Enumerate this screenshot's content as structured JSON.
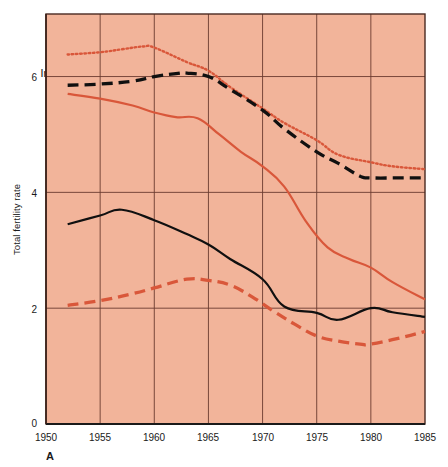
{
  "figure": {
    "panel_letter": "A",
    "background_color": "#ffffff",
    "plot_background_color": "#f2b49a",
    "axis_color": "#4a2a22",
    "grid_color": "#6b3b30"
  },
  "chart_data": {
    "type": "line",
    "title": "",
    "xlabel": "",
    "ylabel": "Total fertility rate",
    "xlim": [
      1950,
      1985
    ],
    "ylim": [
      0,
      7.08
    ],
    "grid": true,
    "legend": "inline-labels",
    "xticks": [
      "1950",
      "1955",
      "1960",
      "1965",
      "1970",
      "1975",
      "1980",
      "1985"
    ],
    "yticks": [
      "0",
      "2",
      "4",
      "6"
    ],
    "series": [
      {
        "name": "India",
        "color": "#d9573a",
        "style": "dotted",
        "label_x": 1951.2,
        "label_y": 6.85,
        "x": [
          1952,
          1955,
          1957,
          1959,
          1960,
          1963,
          1965,
          1967,
          1970,
          1972,
          1975,
          1977,
          1980,
          1982,
          1985
        ],
        "y": [
          6.38,
          6.42,
          6.47,
          6.52,
          6.5,
          6.25,
          6.1,
          5.82,
          5.45,
          5.2,
          4.9,
          4.65,
          4.52,
          4.45,
          4.4
        ]
      },
      {
        "name": "Indonesia",
        "color": "#101010",
        "style": "dashed",
        "label_x": 1950.6,
        "label_y": 6.02,
        "x": [
          1952,
          1955,
          1958,
          1960,
          1962,
          1963,
          1965,
          1967,
          1970,
          1972,
          1975,
          1977,
          1979,
          1980,
          1983,
          1985
        ],
        "y": [
          5.85,
          5.87,
          5.92,
          6.0,
          6.05,
          6.06,
          6.0,
          5.78,
          5.42,
          5.1,
          4.7,
          4.5,
          4.28,
          4.25,
          4.25,
          4.25
        ]
      },
      {
        "name": "China",
        "color": "#d9573a",
        "style": "solid",
        "label_x": 1951.2,
        "label_y": 5.35,
        "x": [
          1952,
          1955,
          1958,
          1960,
          1962,
          1964,
          1966,
          1968,
          1970,
          1972,
          1974,
          1976,
          1978,
          1980,
          1982,
          1985
        ],
        "y": [
          5.7,
          5.62,
          5.5,
          5.38,
          5.3,
          5.28,
          5.0,
          4.7,
          4.45,
          4.1,
          3.5,
          3.05,
          2.85,
          2.7,
          2.45,
          2.15
        ]
      },
      {
        "name": "U.S.",
        "color": "#101010",
        "style": "solid",
        "label_x": 1951.2,
        "label_y": 3.78,
        "x": [
          1952,
          1955,
          1957,
          1960,
          1963,
          1965,
          1967,
          1970,
          1972,
          1975,
          1977,
          1980,
          1982,
          1985
        ],
        "y": [
          3.45,
          3.6,
          3.7,
          3.52,
          3.28,
          3.1,
          2.85,
          2.5,
          2.03,
          1.92,
          1.8,
          2.0,
          1.93,
          1.85
        ]
      },
      {
        "name": "West Germany",
        "color": "#d9573a",
        "style": "dashed",
        "label_x": 1951.0,
        "label_y": 2.68,
        "x": [
          1952,
          1955,
          1958,
          1960,
          1963,
          1965,
          1967,
          1969,
          1971,
          1973,
          1975,
          1977,
          1979,
          1980,
          1983,
          1985
        ],
        "y": [
          2.05,
          2.13,
          2.25,
          2.35,
          2.5,
          2.48,
          2.4,
          2.2,
          1.95,
          1.72,
          1.52,
          1.43,
          1.38,
          1.38,
          1.5,
          1.6
        ]
      }
    ]
  }
}
